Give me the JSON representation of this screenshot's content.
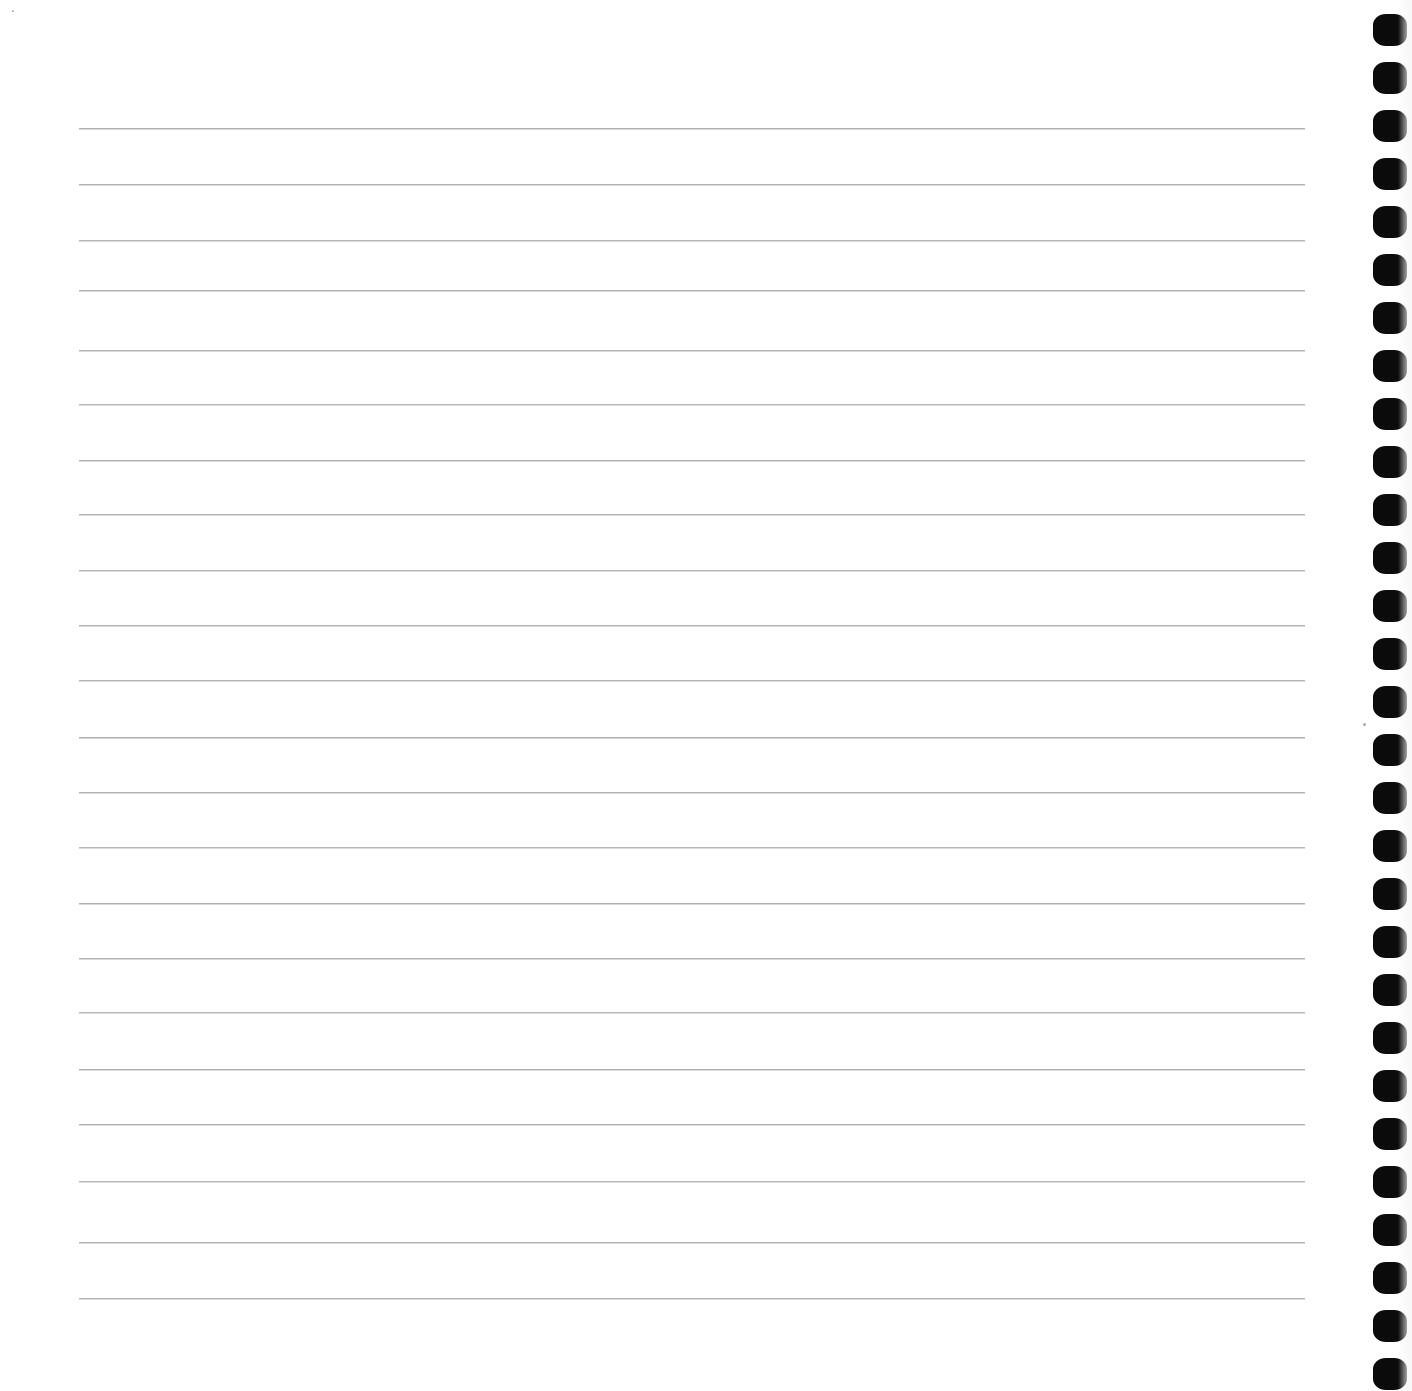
{
  "document": {
    "kind": "scanned-notebook-page",
    "title": "Blank ruled notebook page",
    "page_width": 1412,
    "page_height": 1391,
    "background_color": "#ffffff",
    "content_text": "",
    "handwriting_present": "none",
    "printed_text_present": "none"
  },
  "paper": {
    "name": "lined-paper",
    "surface_color": "#fefefe",
    "rule_color": "#96989c",
    "rule_thickness_px": 2,
    "rule_left_x": 79,
    "rule_right_x": 1305,
    "rule_spacing_px": 56,
    "first_rule_y": 128,
    "rule_count": 22,
    "rule_y_positions": [
      128,
      184,
      240,
      290,
      350,
      404,
      460,
      514,
      570,
      625,
      680,
      737,
      792,
      847,
      903,
      958,
      1012,
      1069,
      1124,
      1181,
      1242,
      1298
    ]
  },
  "binding": {
    "name": "spiral-binding-edge",
    "side": "right",
    "hole_color": "#0b0b0b",
    "hole_shape": "rounded-rectangle",
    "hole_width_px": 34,
    "hole_height_px": 32,
    "hole_left_x": 1373,
    "hole_spacing_px": 48,
    "first_hole_y": 14,
    "hole_count": 29
  },
  "artifacts": {
    "name": "scan-artifacts",
    "specks": [
      {
        "x": 1363,
        "y": 723,
        "size": 3
      },
      {
        "x": 12,
        "y": 10,
        "size": 2
      }
    ]
  }
}
